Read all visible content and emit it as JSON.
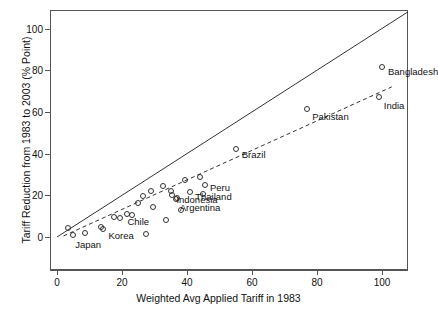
{
  "chart_data": {
    "type": "scatter",
    "title": "",
    "xlabel": "Weighted Avg Applied Tariff in 1983",
    "ylabel": "Tariff Reduction from 1983 to 2003 (% Point)",
    "xlim": [
      -3,
      110
    ],
    "ylim": [
      -4,
      108
    ],
    "xticks": [
      0,
      20,
      40,
      60,
      80,
      100
    ],
    "yticks": [
      0,
      20,
      40,
      60,
      80,
      100
    ],
    "grid": false,
    "legend": "none",
    "reference_lines": [
      {
        "name": "forty-five-degree-line",
        "style": "solid",
        "x": [
          0,
          108
        ],
        "y": [
          0,
          108
        ]
      },
      {
        "name": "regression-fit-line",
        "style": "dashed",
        "x": [
          2,
          103
        ],
        "y": [
          0.5,
          72
        ]
      }
    ],
    "points": [
      {
        "label": "Japan",
        "x": 5.0,
        "y": 1.0,
        "label_dx": 2,
        "label_dy": 9
      },
      {
        "label": "",
        "x": 3.5,
        "y": 4.5
      },
      {
        "label": "",
        "x": 8.5,
        "y": 2.0
      },
      {
        "label": "Korea",
        "x": 14.0,
        "y": 4.0,
        "label_dx": 6,
        "label_dy": 6
      },
      {
        "label": "",
        "x": 13.5,
        "y": 5.0
      },
      {
        "label": "",
        "x": 27.5,
        "y": 1.5
      },
      {
        "label": "Chile",
        "x": 19.5,
        "y": 9.0,
        "label_dx": 7,
        "label_dy": 3
      },
      {
        "label": "",
        "x": 17.5,
        "y": 9.5
      },
      {
        "label": "",
        "x": 21.5,
        "y": 11.0
      },
      {
        "label": "",
        "x": 23.0,
        "y": 10.5
      },
      {
        "label": "",
        "x": 33.5,
        "y": 8.0
      },
      {
        "label": "",
        "x": 25.0,
        "y": 16.5
      },
      {
        "label": "",
        "x": 26.5,
        "y": 19.5
      },
      {
        "label": "",
        "x": 29.5,
        "y": 14.5
      },
      {
        "label": "",
        "x": 38.0,
        "y": 13.0
      },
      {
        "label": "",
        "x": 29.0,
        "y": 22.0
      },
      {
        "label": "",
        "x": 32.5,
        "y": 24.5
      },
      {
        "label": "",
        "x": 35.0,
        "y": 22.0
      },
      {
        "label": "Indonesia",
        "x": 35.5,
        "y": 20.0,
        "label_dx": 4,
        "label_dy": 4
      },
      {
        "label": "Argentina",
        "x": 36.5,
        "y": 18.0,
        "label_dx": 4,
        "label_dy": 8
      },
      {
        "label": "",
        "x": 37.0,
        "y": 18.5
      },
      {
        "label": "Thailand",
        "x": 41.0,
        "y": 21.5,
        "label_dx": 5,
        "label_dy": 4
      },
      {
        "label": "",
        "x": 45.0,
        "y": 20.5
      },
      {
        "label": "",
        "x": 39.5,
        "y": 27.5
      },
      {
        "label": "Peru",
        "x": 45.5,
        "y": 25.0,
        "label_dx": 5,
        "label_dy": 2
      },
      {
        "label": "",
        "x": 44.0,
        "y": 29.0
      },
      {
        "label": "Brazil",
        "x": 55.0,
        "y": 42.0,
        "label_dx": 6,
        "label_dy": 5
      },
      {
        "label": "Pakistan",
        "x": 77.0,
        "y": 61.5,
        "label_dx": 5,
        "label_dy": 7
      },
      {
        "label": "India",
        "x": 99.0,
        "y": 67.0,
        "label_dx": 5,
        "label_dy": 8
      },
      {
        "label": "Bangladesh",
        "x": 100.0,
        "y": 81.5,
        "label_dx": 6,
        "label_dy": 4
      }
    ]
  }
}
